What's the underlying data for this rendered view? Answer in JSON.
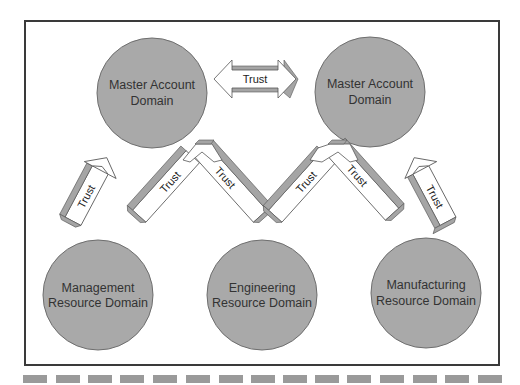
{
  "diagram": {
    "colors": {
      "circle_fill": "#a9a9a9",
      "circle_stroke": "#6e6e6e",
      "arrow_face": "#ffffff",
      "arrow_side": "#a5a5a5",
      "frame": "#3a3a3a",
      "dash": "#9a9a9a"
    },
    "nodes": [
      {
        "id": "master1",
        "line1": "Master Account",
        "line2": "Domain",
        "cx": 152,
        "cy": 93,
        "r": 55
      },
      {
        "id": "master2",
        "line1": "Master Account",
        "line2": "Domain",
        "cx": 370,
        "cy": 92,
        "r": 55
      },
      {
        "id": "mgmt",
        "line1": "Management",
        "line2": "Resource Domain",
        "cx": 98,
        "cy": 295,
        "r": 55
      },
      {
        "id": "eng",
        "line1": "Engineering",
        "line2": "Resource Domain",
        "cx": 262,
        "cy": 295,
        "r": 55
      },
      {
        "id": "mfg",
        "line1": "Manufacturing",
        "line2": "Resource Domain",
        "cx": 426,
        "cy": 293,
        "r": 55
      }
    ],
    "trusts": [
      {
        "from": "master1",
        "to": "master2",
        "label": "Trust",
        "direction": "bidirectional"
      },
      {
        "from": "mgmt",
        "to": "master1",
        "label": "Trust"
      },
      {
        "from": "eng",
        "to": "master1",
        "label": "Trust"
      },
      {
        "from": "eng",
        "to": "master1",
        "label": "Trust"
      },
      {
        "from": "eng",
        "to": "master2",
        "label": "Trust"
      },
      {
        "from": "mfg",
        "to": "master2",
        "label": "Trust"
      },
      {
        "from": "mfg",
        "to": "master2",
        "label": "Trust"
      }
    ],
    "trust_label": "Trust",
    "dash_count": 15
  }
}
